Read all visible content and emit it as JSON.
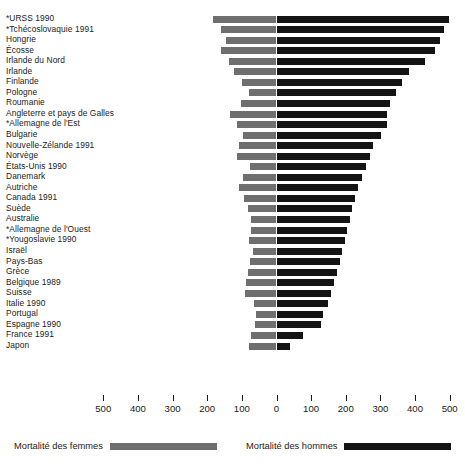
{
  "chart_data": {
    "type": "bar",
    "subtype": "diverging-horizontal-bar",
    "title": "",
    "xlabel": "",
    "ylabel": "",
    "xlim": [
      -500,
      500
    ],
    "axis_ticks": [
      500,
      400,
      300,
      200,
      100,
      0,
      100,
      200,
      300,
      400,
      500
    ],
    "grid": false,
    "legend_position": "bottom",
    "categories": [
      "*URSS 1990",
      "*Tchécoslovaquie 1991",
      "Hongrie",
      "Écosse",
      "Irlande du Nord",
      "Irlande",
      "Finlande",
      "Pologne",
      "Roumanie",
      "Angleterre et pays de Galles",
      "*Allemagne de l'Est",
      "Bulgarie",
      "Nouvelle-Zélande 1991",
      "Norvège",
      "États-Unis 1990",
      "Danemark",
      "Autriche",
      "Canada 1991",
      "Suède",
      "Australie",
      "*Allemagne de l'Ouest",
      "*Yougoslavie 1990",
      "Israël",
      "Pays-Bas",
      "Grèce",
      "Belgique 1989",
      "Suisse",
      "Italie 1990",
      "Portugal",
      "Espagne 1990",
      "France 1991",
      "Japon"
    ],
    "series": [
      {
        "name": "Mortalité des femmes",
        "color": "#6f6f6f",
        "side": "left",
        "values": [
          183,
          160,
          146,
          160,
          137,
          122,
          99,
          80,
          103,
          134,
          115,
          97,
          108,
          114,
          77,
          97,
          108,
          94,
          82,
          74,
          73,
          80,
          68,
          77,
          82,
          88,
          91,
          65,
          59,
          62,
          74,
          80
        ]
      },
      {
        "name": "Mortalité des hommes",
        "color": "#141414",
        "side": "right",
        "values": [
          498,
          483,
          472,
          458,
          429,
          383,
          363,
          345,
          328,
          320,
          319,
          302,
          279,
          270,
          258,
          247,
          236,
          227,
          218,
          212,
          204,
          198,
          189,
          183,
          175,
          166,
          157,
          148,
          134,
          128,
          77,
          39
        ]
      }
    ]
  },
  "legend": {
    "femmes_label": "Mortalité des femmes",
    "hommes_label": "Mortalité des hommes"
  },
  "colors": {
    "femmes": "#6f6f6f",
    "hommes": "#141414",
    "text": "#1a1a1a",
    "background": "#ffffff"
  }
}
